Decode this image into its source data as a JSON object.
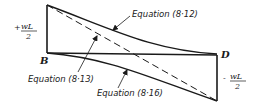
{
  "diagram": {
    "type": "shear-force-diagram",
    "points": {
      "B": "B",
      "D": "D"
    },
    "left_value": {
      "sign": "+",
      "numerator": "wL",
      "denominator": "2"
    },
    "right_value": {
      "sign": "-",
      "numerator": "wL",
      "denominator": "2"
    },
    "curves": [
      {
        "id": "eq-8-12",
        "label": "Equation (8·12)",
        "style": "solid",
        "description": "upper curve from top-left to D"
      },
      {
        "id": "eq-8-13",
        "label": "Equation (8·13)",
        "style": "dashed",
        "description": "straight diagonal from top-left to bottom-right"
      },
      {
        "id": "eq-8-16",
        "label": "Equation (8·16)",
        "style": "solid",
        "description": "lower curve from B to bottom-right"
      }
    ],
    "colors": {
      "ink": "#1a1a1a",
      "background": "#ffffff"
    }
  }
}
